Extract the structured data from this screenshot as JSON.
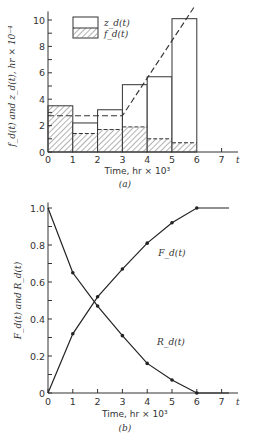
{
  "chart_data": [
    {
      "type": "bar",
      "panel_label": "(a)",
      "title": "",
      "xlabel": "Time, hr × 10³",
      "x_end_label": "t",
      "ylabel": "f_d(t) and z_d(t), hr × 10⁻⁴",
      "xlim": [
        0,
        7.5
      ],
      "ylim": [
        0,
        10.5
      ],
      "xticks": [
        "0",
        "1",
        "2",
        "3",
        "4",
        "5",
        "6",
        "7"
      ],
      "yticks": [
        "0",
        "2",
        "4",
        "6",
        "8",
        "10"
      ],
      "bins": [
        [
          0,
          1
        ],
        [
          1,
          2
        ],
        [
          2,
          3
        ],
        [
          3,
          4
        ],
        [
          4,
          5
        ],
        [
          5,
          6
        ]
      ],
      "series": [
        {
          "name": "z_d(t)",
          "style": "open",
          "values": [
            3.5,
            2.2,
            3.2,
            5.1,
            5.7,
            10.1
          ]
        },
        {
          "name": "f_d(t)",
          "style": "hatched",
          "values": [
            3.5,
            1.4,
            1.7,
            1.9,
            1.0,
            0.7
          ]
        }
      ],
      "dashed_line": {
        "name": "trend",
        "points": [
          [
            0,
            2.75
          ],
          [
            3,
            2.75
          ],
          [
            5.9,
            11.0
          ]
        ]
      },
      "legend": {
        "placement": "top-center",
        "entries": [
          "z_d(t)",
          "f_d(t)"
        ]
      }
    },
    {
      "type": "line",
      "panel_label": "(b)",
      "title": "",
      "xlabel": "Time, hr × 10³",
      "x_end_label": "t",
      "ylabel": "F_d(t) and R_d(t)",
      "xlim": [
        0,
        7.5
      ],
      "ylim": [
        0,
        1.0
      ],
      "xticks": [
        "0",
        "1",
        "2",
        "3",
        "4",
        "5",
        "6",
        "7"
      ],
      "yticks": [
        "0",
        "0.2",
        "0.4",
        "0.6",
        "0.8",
        "1.0"
      ],
      "x": [
        0,
        1,
        2,
        3,
        4,
        5,
        6
      ],
      "series": [
        {
          "name": "F_d(t)",
          "values": [
            0,
            0.32,
            0.52,
            0.67,
            0.81,
            0.92,
            1.0
          ],
          "extend_to": 7.3
        },
        {
          "name": "R_d(t)",
          "values": [
            1.0,
            0.65,
            0.47,
            0.31,
            0.16,
            0.07,
            0.0
          ],
          "extend_to": 7.3
        }
      ],
      "annotations": [
        {
          "text": "F_d(t)",
          "near": "series F_d(t) at t≈4.8"
        },
        {
          "text": "R_d(t)",
          "near": "series R_d(t) at t≈4.8"
        }
      ]
    }
  ]
}
